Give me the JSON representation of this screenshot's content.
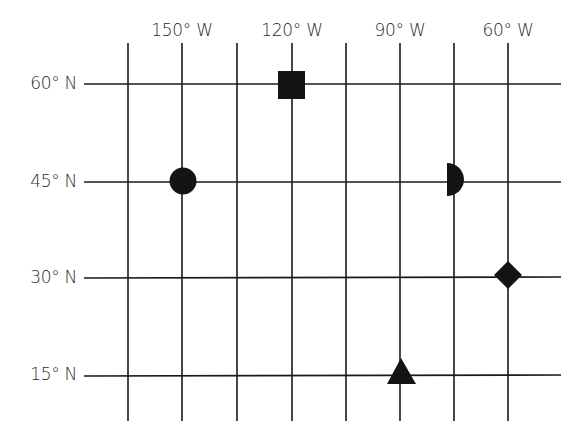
{
  "diagram": {
    "type": "latitude-longitude-grid",
    "line_color": "#1a1a1a",
    "marker_color": "#141414",
    "longitude_labels": [
      {
        "text": "150° W",
        "x": 182
      },
      {
        "text": "120° W",
        "x": 292
      },
      {
        "text": "90° W",
        "x": 400
      },
      {
        "text": "60° W",
        "x": 508
      }
    ],
    "latitude_labels": [
      {
        "text": "60° N",
        "y": 84
      },
      {
        "text": "45° N",
        "y": 182
      },
      {
        "text": "30° N",
        "y": 278
      },
      {
        "text": "15° N",
        "y": 375
      }
    ],
    "vertical_lines_x": [
      128,
      182,
      237,
      292,
      346,
      400,
      454,
      508
    ],
    "vertical_line_range": [
      43,
      421
    ],
    "horizontal_line_range": [
      84,
      561
    ],
    "markers": [
      {
        "shape": "square",
        "lat": "60° N",
        "lon": "120° W"
      },
      {
        "shape": "circle",
        "lat": "45° N",
        "lon": "150° W"
      },
      {
        "shape": "half-circle",
        "lat": "45° N",
        "lon": "between 90° W and 60° W"
      },
      {
        "shape": "diamond",
        "lat": "30° N",
        "lon": "60° W"
      },
      {
        "shape": "triangle",
        "lat": "15° N",
        "lon": "90° W"
      }
    ]
  }
}
